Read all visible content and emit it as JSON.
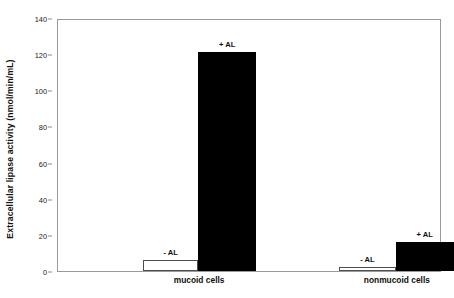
{
  "chart_data": {
    "type": "bar",
    "title": "",
    "subtitle": "",
    "xlabel": "",
    "ylabel": "Extracellular lipase activity (nmol/min/mL)",
    "ylim": [
      0,
      140
    ],
    "yticks": [
      0,
      20,
      40,
      60,
      80,
      100,
      120,
      140
    ],
    "ytick_labels": [
      "0",
      "20",
      "40",
      "60",
      "80",
      "100",
      "120",
      "140"
    ],
    "grid": false,
    "legend": "none",
    "categories": [
      "mucoid cells",
      "nonmucoid cells"
    ],
    "series": [
      {
        "name": "- AL",
        "style": "hollow",
        "color": "#ffffff",
        "edge_color": "#4d4d4d",
        "values": [
          6,
          2
        ]
      },
      {
        "name": "+ AL",
        "style": "filled",
        "color": "#000000",
        "edge_color": "#000000",
        "values": [
          121,
          16
        ]
      }
    ],
    "bars": [
      {
        "group": "mucoid cells",
        "series": "- AL",
        "value": 6,
        "label": "- AL",
        "style": "hollow",
        "x_center_pct": 29.5,
        "width_pct": 14.5
      },
      {
        "group": "mucoid cells",
        "series": "+ AL",
        "value": 121,
        "label": "+ AL",
        "style": "filled",
        "x_center_pct": 44.3,
        "width_pct": 15.1
      },
      {
        "group": "nonmucoid cells",
        "series": "- AL",
        "value": 2,
        "label": "- AL",
        "style": "hollow",
        "x_center_pct": 81.0,
        "width_pct": 14.8
      },
      {
        "group": "nonmucoid cells",
        "series": "+ AL",
        "value": 16,
        "label": "+ AL",
        "style": "filled",
        "x_center_pct": 96.0,
        "width_pct": 15.1
      }
    ],
    "group_label_positions_pct": [
      37.0,
      88.5
    ],
    "axis_color": "#9a9a9a",
    "text_color": "#111111",
    "background": "#ffffff"
  }
}
